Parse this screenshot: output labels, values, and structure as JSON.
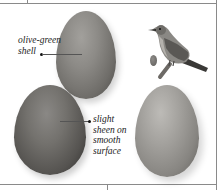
{
  "figure": {
    "annotations": [
      {
        "id": "shell",
        "lines": [
          "olive-green",
          "shell"
        ]
      },
      {
        "id": "sheen",
        "lines": [
          "slight",
          "sheen on",
          "smooth",
          "surface"
        ]
      }
    ],
    "icons": [
      "bird-illustration",
      "small-egg-icon"
    ],
    "colors": {
      "egg_mid": "#8c8a86",
      "egg_dark": "#555350",
      "egg_light": "#a3a19d",
      "border": "#8a8a8a",
      "text": "#222222"
    }
  }
}
